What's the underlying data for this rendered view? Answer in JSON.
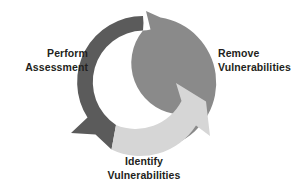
{
  "diagram": {
    "type": "three-stage-circular-arrow-cycle",
    "direction": "clockwise",
    "background_color": "#ffffff",
    "text_color": "#231f20",
    "center": {
      "x": 143,
      "y": 82
    },
    "outer_radius": 66,
    "inner_radius": 31,
    "stages": [
      {
        "id": "perform-assessment",
        "label_line1": "Perform",
        "label_line2": "Assessment",
        "color": "#5b5b5b",
        "color_name": "dark-gray",
        "arc_start_deg": 186,
        "arc_end_deg": 310,
        "arrow_points_to": "down-left",
        "position": "left"
      },
      {
        "id": "remove-vulnerabilities",
        "label_line1": "Remove",
        "label_line2": "Vulnerabilities",
        "color": "#8a8a8a",
        "color_name": "medium-gray",
        "arc_start_deg": 306,
        "arc_end_deg": 70,
        "arrow_points_to": "up-left",
        "position": "right"
      },
      {
        "id": "identify-vulnerabilities",
        "label_line1": "Identify",
        "label_line2": "Vulnerabilities",
        "color": "#d6d6d6",
        "color_name": "light-gray",
        "arc_start_deg": 66,
        "arc_end_deg": 190,
        "arrow_points_to": "up-right",
        "position": "bottom"
      }
    ]
  }
}
